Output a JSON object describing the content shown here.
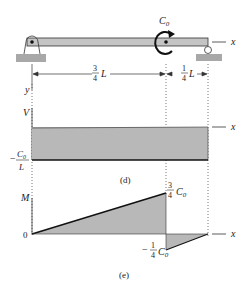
{
  "beam": {
    "moment_label": "C",
    "moment_sub": "0",
    "axis_label": "x",
    "y_label": "y",
    "dim_left_num": "3",
    "dim_left_den": "4",
    "dim_left_var": "L",
    "dim_right_num": "1",
    "dim_right_den": "4",
    "dim_right_var": "L"
  },
  "shear_diagram": {
    "axis_label": "V",
    "x_label": "x",
    "value_num": "C",
    "value_num_sub": "0",
    "value_den": "L",
    "value_sign": "−",
    "caption": "(d)"
  },
  "moment_diagram": {
    "axis_label": "M",
    "zero_label": "0",
    "x_label": "x",
    "peak_num": "3",
    "peak_den": "4",
    "peak_var": "C",
    "peak_sub": "0",
    "neg_sign": "−",
    "neg_num": "1",
    "neg_den": "4",
    "neg_var": "C",
    "neg_sub": "0",
    "caption": "(e)"
  },
  "colors": {
    "fill": "#b8b8b8",
    "line": "#222222",
    "ground": "#a8a8a8"
  }
}
